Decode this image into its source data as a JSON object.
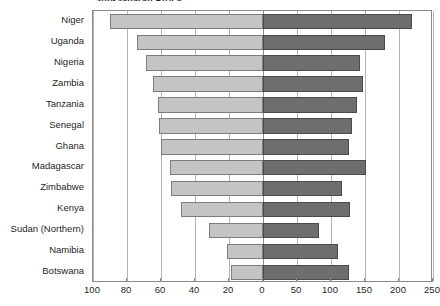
{
  "chart_data": {
    "type": "bar",
    "orientation": "horizontal",
    "style": "bidirectional-population-pyramid",
    "title": "Sub-Saharan Africa",
    "categories": [
      "Niger",
      "Uganda",
      "Nigeria",
      "Zambia",
      "Tanzania",
      "Senegal",
      "Ghana",
      "Madagascar",
      "Zimbabwe",
      "Kenya",
      "Sudan (Northern)",
      "Namibia",
      "Botswana"
    ],
    "series": [
      {
        "name": "left",
        "axis": "left",
        "color": "#c4c4c4",
        "values": [
          90,
          74,
          69,
          65,
          62,
          61,
          60,
          55,
          54,
          48,
          32,
          21,
          19
        ]
      },
      {
        "name": "right",
        "axis": "right",
        "color": "#6e6e6e",
        "values": [
          219,
          180,
          143,
          147,
          138,
          131,
          127,
          152,
          116,
          128,
          82,
          110,
          127
        ]
      }
    ],
    "left_axis": {
      "ticks": [
        100,
        80,
        60,
        40,
        20
      ],
      "min": 0,
      "max": 100,
      "direction": "reversed"
    },
    "right_axis": {
      "ticks": [
        0,
        50,
        100,
        150,
        200,
        250
      ],
      "min": 0,
      "max": 250,
      "direction": "normal"
    },
    "xlabel": "",
    "ylabel": "",
    "grid": true,
    "legend": null
  },
  "axis": {
    "left_tick_labels": [
      "100",
      "80",
      "60",
      "40",
      "20"
    ],
    "right_tick_labels": [
      "0",
      "50",
      "100",
      "150",
      "200",
      "250"
    ]
  },
  "colors": {
    "left_bar": "#c4c4c4",
    "right_bar": "#6e6e6e",
    "grid": "#b4b4b4",
    "frame": "#8a8a8a",
    "text": "#1f1f1f"
  }
}
